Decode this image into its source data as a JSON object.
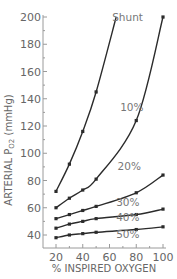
{
  "chart_data": {
    "type": "line",
    "title": "",
    "xlabel": "% INSPIRED OXYGEN",
    "ylabel": "ARTERIAL P_O2 (mmHg)",
    "ylabel_main": "ARTERIAL P",
    "ylabel_sub": "O2",
    "ylabel_unit": " (mmHg)",
    "xlim": [
      20,
      100
    ],
    "ylim": [
      40,
      200
    ],
    "x_ticks": [
      20,
      40,
      60,
      80,
      100
    ],
    "y_ticks": [
      40,
      60,
      80,
      100,
      120,
      140,
      160,
      180,
      200
    ],
    "grid": false,
    "legend_position": "inline labels",
    "annotation": "Shunt",
    "series": [
      {
        "name": "10%",
        "points": [
          [
            20,
            72
          ],
          [
            30,
            92
          ],
          [
            40,
            116
          ],
          [
            50,
            145
          ],
          [
            65,
            200
          ]
        ],
        "marker_count": 4
      },
      {
        "name": "20%",
        "points": [
          [
            20,
            60
          ],
          [
            30,
            67
          ],
          [
            40,
            73
          ],
          [
            50,
            81
          ],
          [
            80,
            124
          ],
          [
            100,
            200
          ]
        ],
        "marker_count": 6
      },
      {
        "name": "30%",
        "points": [
          [
            20,
            52
          ],
          [
            30,
            55
          ],
          [
            40,
            58
          ],
          [
            50,
            61
          ],
          [
            80,
            71
          ],
          [
            100,
            84
          ]
        ],
        "marker_count": 6
      },
      {
        "name": "40%",
        "points": [
          [
            20,
            45
          ],
          [
            30,
            48
          ],
          [
            40,
            50
          ],
          [
            50,
            52
          ],
          [
            80,
            55
          ],
          [
            100,
            59
          ]
        ],
        "marker_count": 6
      },
      {
        "name": "50%",
        "points": [
          [
            20,
            38
          ],
          [
            30,
            40
          ],
          [
            40,
            41
          ],
          [
            50,
            42
          ],
          [
            80,
            44
          ],
          [
            100,
            46
          ]
        ],
        "marker_count": 6
      }
    ],
    "label_positions": {
      "Shunt": [
        62,
        200
      ],
      "10%": [
        68,
        134
      ],
      "20%": [
        66,
        91
      ],
      "30%": [
        65,
        64
      ],
      "40%": [
        65,
        53
      ],
      "50%": [
        65,
        41
      ]
    }
  }
}
